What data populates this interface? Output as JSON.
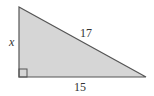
{
  "diagram": {
    "type": "right-triangle",
    "fill_color": "#d6d6d6",
    "stroke_color": "#555555",
    "labels": {
      "vertical_leg": "x",
      "hypotenuse": "17",
      "horizontal_leg": "15"
    },
    "right_angle_marker": true
  }
}
